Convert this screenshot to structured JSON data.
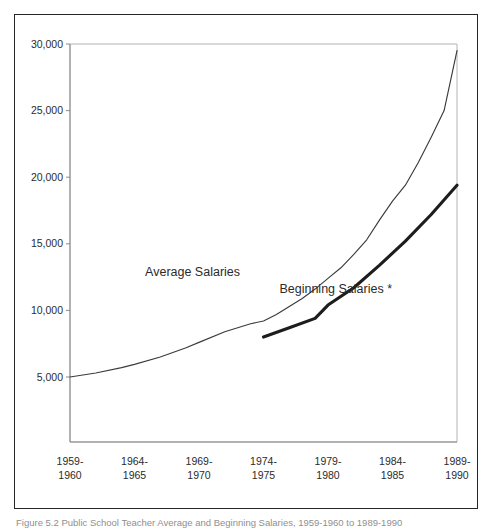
{
  "figure": {
    "caption": "Figure 5.2  Public School Teacher Average and Beginning Salaries, 1959-1960 to 1989-1990"
  },
  "chart_data": {
    "type": "line",
    "title": "",
    "xlabel": "",
    "ylabel": "",
    "grid": false,
    "legend": "inline-labels",
    "xlim": [
      1959,
      1990
    ],
    "ylim": [
      0,
      30000
    ],
    "y_ticks": [
      30000,
      25000,
      20000,
      15000,
      10000,
      5000
    ],
    "y_tick_labels": [
      "30,000",
      "25,000",
      "20,000",
      "15,000",
      "10,000",
      "5,000"
    ],
    "x_ticks": [
      1959,
      1964,
      1969,
      1974,
      1979,
      1984,
      1989
    ],
    "x_tick_labels": [
      {
        "top": "1959-",
        "bottom": "1960"
      },
      {
        "top": "1964-",
        "bottom": "1965"
      },
      {
        "top": "1969-",
        "bottom": "1970"
      },
      {
        "top": "1974-",
        "bottom": "1975"
      },
      {
        "top": "1979-",
        "bottom": "1980"
      },
      {
        "top": "1984-",
        "bottom": "1985"
      },
      {
        "top": "1989-",
        "bottom": "1990"
      }
    ],
    "series": [
      {
        "name": "Average Salaries",
        "label": "Average Salaries",
        "style": "thin",
        "color": "#3b3b3b",
        "x": [
          1959,
          1961,
          1963,
          1964,
          1966,
          1968,
          1969,
          1971,
          1973,
          1974,
          1975,
          1976,
          1977,
          1978,
          1979,
          1980,
          1981,
          1982,
          1983,
          1984,
          1985,
          1986,
          1987,
          1988,
          1989
        ],
        "values": [
          5000,
          5300,
          5700,
          5950,
          6500,
          7200,
          7600,
          8400,
          9000,
          9200,
          9700,
          10300,
          10900,
          11600,
          12400,
          13200,
          14200,
          15300,
          16800,
          18200,
          19400,
          21100,
          23000,
          25000,
          29500
        ]
      },
      {
        "name": "Beginning Salaries",
        "label": "Beginning Salaries *",
        "style": "bold",
        "color": "#1d1d1d",
        "x": [
          1974,
          1976,
          1978,
          1979,
          1981,
          1983,
          1985,
          1987,
          1989
        ],
        "values": [
          8000,
          8700,
          9400,
          10400,
          11700,
          13400,
          15200,
          17200,
          19400
        ]
      }
    ],
    "annotations": [
      {
        "text": "Average Salaries",
        "x": 1968.5,
        "y": 12600
      },
      {
        "text": "Beginning Salaries *",
        "x": 1979.6,
        "y": 11300
      }
    ]
  }
}
